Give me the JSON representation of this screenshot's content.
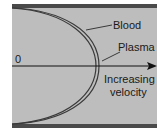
{
  "diagram": {
    "type": "velocity-profile",
    "colors": {
      "background": "#bdbdbd",
      "wall": "#4a4a4a",
      "curve": "#3a3a3a",
      "axis": "#111111",
      "text": "#1a1a1a"
    },
    "labels": {
      "blood": "Blood",
      "plasma": "Plasma",
      "origin": "0",
      "axis_line1": "Increasing",
      "axis_line2": "velocity"
    },
    "curves": [
      {
        "name": "Blood",
        "apex_x": 96
      },
      {
        "name": "Plasma",
        "apex_x": 99
      }
    ]
  }
}
